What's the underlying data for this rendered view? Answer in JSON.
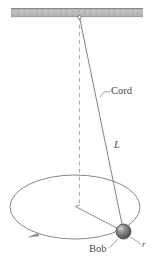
{
  "figure": {
    "name": "conical-pendulum",
    "caption_labels": {
      "cord": "Cord",
      "length": "L",
      "bob": "Bob",
      "radius": "r"
    },
    "colors": {
      "ceiling_fill_light": "#c9c9c9",
      "ceiling_fill_dark": "#a8a8a8",
      "ceiling_edge": "#8f8f8f",
      "line": "#7d7d7d",
      "dashed_line": "#a0a0a0",
      "bob_fill_light": "#b5b5b5",
      "bob_fill_dark": "#555555",
      "bob_edge": "#4f4f4f",
      "text": "#4a4a4a",
      "background": "#ffffff"
    },
    "geometry": {
      "canvas_width": 153,
      "canvas_height": 258,
      "ceiling": {
        "x": 11,
        "y": 8,
        "width": 132,
        "height": 9
      },
      "pivot": {
        "x": 79.5,
        "y": 17,
        "radius": 1.6
      },
      "vertical_axis": {
        "x": 79.5,
        "y_top": 17,
        "y_bottom": 205
      },
      "cord": {
        "x1": 79.5,
        "y1": 17,
        "x2": 123.5,
        "y2": 231.5
      },
      "orbit_ellipse": {
        "cx": 75,
        "cy": 207,
        "rx": 65,
        "ry": 32
      },
      "radius_line": {
        "x1": 75,
        "y1": 206,
        "x2": 123.5,
        "y2": 231.5
      },
      "bob": {
        "cx": 123.5,
        "cy": 231.5,
        "r": 7.5
      },
      "motion_arrow": {
        "x": 33,
        "y": 235,
        "direction": "counterclockwise"
      },
      "cord_leader": {
        "x1": 100,
        "y1": 96,
        "x2": 109,
        "y2": 92
      },
      "bob_leader": {
        "x1": 110,
        "y1": 247,
        "x2": 119,
        "y2": 239
      },
      "radius_leader": {
        "x1": 131,
        "y1": 237,
        "x2": 141,
        "y2": 244
      }
    }
  }
}
